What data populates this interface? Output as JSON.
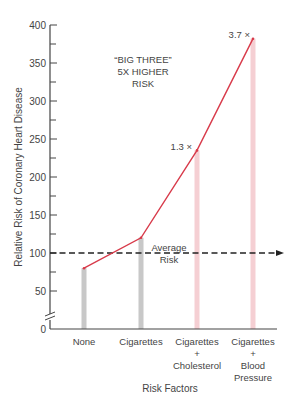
{
  "chart_data": {
    "type": "line",
    "title": "",
    "xlabel": "Risk Factors",
    "ylabel": "Relative Risk of Coronary Heart Disease",
    "ylim": [
      0,
      400
    ],
    "yticks": [
      0,
      50,
      100,
      150,
      200,
      250,
      300,
      350,
      400
    ],
    "ytick_labels": [
      "0",
      "50",
      "100",
      "150",
      "200",
      "250",
      "300",
      "350",
      "400"
    ],
    "categories": [
      [
        "None"
      ],
      [
        "Cigarettes"
      ],
      [
        "Cigarettes",
        "+",
        "Cholesterol"
      ],
      [
        "Cigarettes",
        "+",
        "Blood",
        "Pressure"
      ]
    ],
    "series": [
      {
        "name": "Relative Risk",
        "values": [
          80,
          120,
          235,
          382
        ],
        "color": "#d83a4a"
      }
    ],
    "reference_line": {
      "label": [
        "Average",
        "Risk"
      ],
      "value": 100,
      "style": "dashed",
      "color": "#222222"
    },
    "annotations": [
      {
        "text": [
          "“BIG THREE”",
          "5X HIGHER",
          "RISK"
        ]
      },
      {
        "text": "1.3 ×",
        "category_index": 2
      },
      {
        "text": "3.7 ×",
        "category_index": 3
      }
    ],
    "bar_colors": [
      "#c8c8c8",
      "#c8c8c8",
      "#f5cfd3",
      "#f5cfd3"
    ],
    "axis_break": true,
    "grid": false,
    "legend": "none"
  }
}
